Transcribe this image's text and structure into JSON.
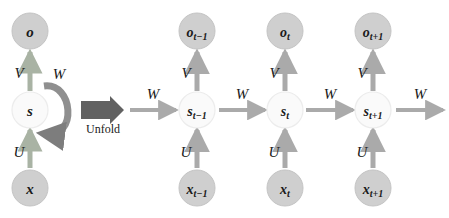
{
  "diagram": {
    "background_color": "#ffffff",
    "colors": {
      "node_dark_fill": "#cfcfcf",
      "node_dark_stroke": "#c4c4c4",
      "node_light_fill": "#fafafa",
      "node_light_stroke": "#ededed",
      "arrow_gray": "#aaaaaa",
      "arrow_green_gray": "#a9b3a4",
      "arrow_dark": "#5a5a5a",
      "unfold_block": "#616161",
      "text_color": "#1a1a1a"
    },
    "folded": {
      "caption": "Unfold",
      "nodes": {
        "output": {
          "label": "o",
          "sub": "",
          "kind": "output"
        },
        "state": {
          "label": "s",
          "sub": "",
          "kind": "state"
        },
        "input": {
          "label": "x",
          "sub": "",
          "kind": "input"
        }
      },
      "edges": {
        "output_weight": "V",
        "input_weight": "U",
        "recurrent_weight": "W"
      }
    },
    "unfolded": {
      "incoming_weight": "W",
      "outgoing_weight": "W",
      "timesteps": [
        {
          "id": "t-minus-1",
          "output": {
            "label": "o",
            "sub": "t−1"
          },
          "state": {
            "label": "s",
            "sub": "t−1"
          },
          "input": {
            "label": "x",
            "sub": "t−1"
          },
          "output_weight": "V",
          "input_weight": "U",
          "recurrent_weight_out": "W"
        },
        {
          "id": "t",
          "output": {
            "label": "o",
            "sub": "t"
          },
          "state": {
            "label": "s",
            "sub": "t"
          },
          "input": {
            "label": "x",
            "sub": "t"
          },
          "output_weight": "V",
          "input_weight": "U",
          "recurrent_weight_out": "W"
        },
        {
          "id": "t-plus-1",
          "output": {
            "label": "o",
            "sub": "t+1"
          },
          "state": {
            "label": "s",
            "sub": "t+1"
          },
          "input": {
            "label": "x",
            "sub": "t+1"
          },
          "output_weight": "V",
          "input_weight": "U",
          "recurrent_weight_out": "W"
        }
      ]
    }
  }
}
